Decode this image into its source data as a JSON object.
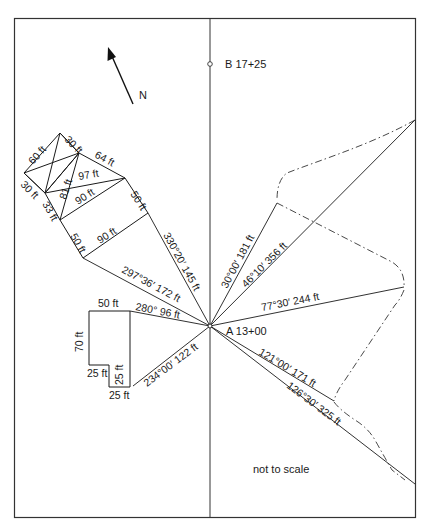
{
  "diagram": {
    "note": "not to scale",
    "north_label": "N",
    "stations": {
      "A": {
        "label": "A 13+00"
      },
      "B": {
        "label": "B 17+25"
      }
    },
    "radial_lines": [
      {
        "id": "r1",
        "label": "330°20′ 145 ft"
      },
      {
        "id": "r2",
        "label": "297°36′ 172 ft"
      },
      {
        "id": "r3",
        "label": "280° 96 ft"
      },
      {
        "id": "r4",
        "label": "234°00′ 122 ft"
      },
      {
        "id": "r5",
        "label": "30°00′ 181 ft"
      },
      {
        "id": "r6",
        "label": "46°10′ 356 ft"
      },
      {
        "id": "r7",
        "label": "77°30′ 244 ft"
      },
      {
        "id": "r8",
        "label": "121°00′ 171 ft"
      },
      {
        "id": "r9",
        "label": "126°30′ 325 ft"
      }
    ],
    "building_1": {
      "dims": [
        {
          "id": "b1a",
          "label": "60 ft"
        },
        {
          "id": "b1b",
          "label": "30 ft"
        },
        {
          "id": "b1c",
          "label": "64 ft"
        },
        {
          "id": "b1d",
          "label": "30 ft"
        },
        {
          "id": "b1e",
          "label": "81 ft"
        },
        {
          "id": "b1f",
          "label": "97 ft"
        },
        {
          "id": "b1g",
          "label": "90 ft"
        },
        {
          "id": "b1h",
          "label": "50 ft"
        },
        {
          "id": "b1i",
          "label": "33 ft"
        },
        {
          "id": "b1j",
          "label": "50 ft"
        },
        {
          "id": "b1k",
          "label": "90 ft"
        }
      ]
    },
    "building_2": {
      "dims": [
        {
          "id": "b2a",
          "label": "50 ft"
        },
        {
          "id": "b2b",
          "label": "70 ft"
        },
        {
          "id": "b2c",
          "label": "25 ft"
        },
        {
          "id": "b2d",
          "label": "25 ft"
        },
        {
          "id": "b2e",
          "label": "25 ft"
        }
      ]
    },
    "colors": {
      "line": "#1a1a1a",
      "frame": "#333333",
      "background": "#ffffff"
    }
  }
}
